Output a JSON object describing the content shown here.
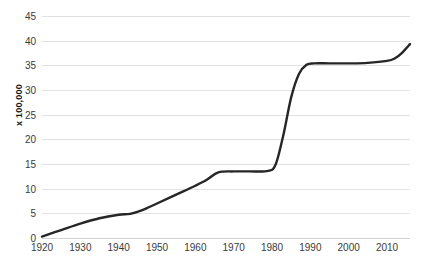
{
  "chart_data": {
    "type": "line",
    "title": "",
    "xlabel": "",
    "ylabel": "x 100,000",
    "xlim": [
      1920,
      2016
    ],
    "ylim": [
      0,
      45
    ],
    "grid": true,
    "legend": "none",
    "y_ticks": [
      0,
      5,
      10,
      15,
      20,
      25,
      30,
      35,
      40,
      45
    ],
    "x_ticks": [
      1920,
      1930,
      1940,
      1950,
      1960,
      1970,
      1980,
      1990,
      2000,
      2010
    ],
    "line_color": "#262626",
    "line_width": 2.4,
    "series": [
      {
        "name": "value",
        "x": [
          1920,
          1925,
          1930,
          1935,
          1940,
          1943,
          1946,
          1950,
          1955,
          1960,
          1963,
          1966,
          1970,
          1974,
          1979,
          1981,
          1983,
          1985,
          1987,
          1989,
          1991,
          1995,
          2000,
          2005,
          2010,
          2012,
          2014,
          2016
        ],
        "values": [
          0.3,
          1.6,
          2.9,
          4.0,
          4.7,
          4.9,
          5.6,
          7.0,
          8.8,
          10.6,
          11.8,
          13.3,
          13.5,
          13.5,
          13.6,
          15.0,
          21.0,
          28.5,
          33.2,
          35.1,
          35.4,
          35.4,
          35.4,
          35.5,
          35.9,
          36.4,
          37.6,
          39.3
        ]
      }
    ]
  },
  "axis": {
    "y_tick_labels": [
      "0",
      "5",
      "10",
      "15",
      "20",
      "25",
      "30",
      "35",
      "40",
      "45"
    ],
    "x_tick_labels": [
      "1920",
      "1930",
      "1940",
      "1950",
      "1960",
      "1970",
      "1980",
      "1990",
      "2000",
      "2010"
    ]
  }
}
